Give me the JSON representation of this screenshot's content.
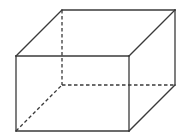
{
  "diagram": {
    "type": "rectangular-prism-wireframe",
    "colors": {
      "stroke": "#3a3a3a",
      "background": "#ffffff"
    },
    "vertices": {
      "front_top_left": [
        16,
        56
      ],
      "front_top_right": [
        129,
        56
      ],
      "front_bottom_right": [
        129,
        131
      ],
      "front_bottom_left": [
        16,
        131
      ],
      "back_top_left": [
        62,
        10
      ],
      "back_top_right": [
        175,
        10
      ],
      "back_bottom_right": [
        175,
        85
      ],
      "back_bottom_left": [
        62,
        85
      ]
    },
    "visible_edges": [
      [
        "front_top_left",
        "front_top_right"
      ],
      [
        "front_top_right",
        "front_bottom_right"
      ],
      [
        "front_bottom_right",
        "front_bottom_left"
      ],
      [
        "front_bottom_left",
        "front_top_left"
      ],
      [
        "back_top_left",
        "back_top_right"
      ],
      [
        "back_top_right",
        "back_bottom_right"
      ],
      [
        "front_top_left",
        "back_top_left"
      ],
      [
        "front_top_right",
        "back_top_right"
      ],
      [
        "front_bottom_right",
        "back_bottom_right"
      ]
    ],
    "hidden_edges": [
      [
        "back_top_left",
        "back_bottom_left"
      ],
      [
        "back_bottom_left",
        "back_bottom_right"
      ],
      [
        "front_bottom_left",
        "back_bottom_left"
      ]
    ]
  }
}
